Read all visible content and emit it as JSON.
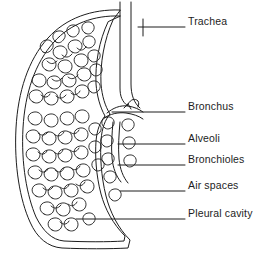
{
  "figure": {
    "type": "line-drawing",
    "background_color": "#ffffff",
    "ink_color": "#1d1d1d",
    "width": 275,
    "height": 268
  },
  "labels": [
    {
      "id": "trachea",
      "text": "Trachea",
      "x": 188,
      "y": 16,
      "leader_y": 27,
      "leader_x1": 138,
      "leader_x2": 185
    },
    {
      "id": "bronchus",
      "text": "Bronchus",
      "x": 188,
      "y": 101,
      "leader_y": 112,
      "leader_x1": 112,
      "leader_x2": 185
    },
    {
      "id": "alveoli",
      "text": "Alveoli",
      "x": 188,
      "y": 133,
      "leader_y": 144,
      "leader_x1": 118,
      "leader_x2": 185
    },
    {
      "id": "bronchioles",
      "text": "Bronchioles",
      "x": 188,
      "y": 154,
      "leader_y": 165,
      "leader_x1": 118,
      "leader_x2": 185
    },
    {
      "id": "air-spaces",
      "text": "Air spaces",
      "x": 188,
      "y": 180,
      "leader_y": 191,
      "leader_x1": 120,
      "leader_x2": 185
    },
    {
      "id": "pleural-cavity",
      "text": "Pleural cavity",
      "x": 188,
      "y": 208,
      "leader_y": 219,
      "leader_x1": 76,
      "leader_x2": 185
    }
  ],
  "structures": {
    "pleura_outer": "Outer pleural membrane outline of the lung",
    "pleura_inner": "Inner pleural membrane outline of the lung",
    "trachea": "Vertical airway tube entering the lung at the top",
    "bronchus": "Main airway branch at the hilum",
    "alveolar_tissue": "Clustered alveolar sacs filling the lung interior",
    "trachea_tick": "Short vertical tick mark crossing the trachea leader line",
    "bronchus_arrow": "Small hooked arrowhead at the bronchus leader line"
  }
}
